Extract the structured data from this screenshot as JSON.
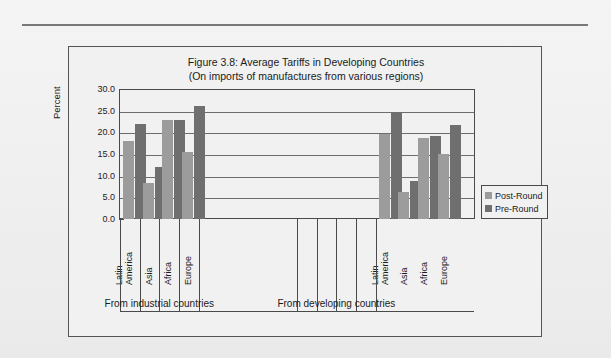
{
  "figure": {
    "title_line1": "Figure 3.8: Average Tariffs in Developing Countries",
    "title_line2": "(On imports of manufactures from various regions)"
  },
  "legend": {
    "items": [
      {
        "label": "Post-Round",
        "color": "#9c9c9c"
      },
      {
        "label": "Pre-Round",
        "color": "#6f6f6f"
      }
    ]
  },
  "groups": [
    {
      "caption": "From industrial countries"
    },
    {
      "caption": "From developing countries"
    }
  ],
  "categories_display": [
    {
      "line1": "Latin",
      "line2": "America"
    },
    {
      "line1": "Asia",
      "line2": ""
    },
    {
      "line1": "Africa",
      "line2": ""
    },
    {
      "line1": "Europe",
      "line2": ""
    }
  ],
  "chart_data": {
    "type": "bar",
    "title": "Figure 3.8: Average Tariffs in Developing Countries (On imports of manufactures from various regions)",
    "xlabel": "",
    "ylabel": "Percent",
    "ylim": [
      0.0,
      30.0
    ],
    "ytick_labels": [
      "30.0",
      "25.0",
      "20.0",
      "15.0",
      "10.0",
      "5.0",
      "0.0"
    ],
    "ytick_values": [
      30.0,
      25.0,
      20.0,
      15.0,
      10.0,
      5.0,
      0.0
    ],
    "grid": true,
    "legend_position": "right",
    "groups": [
      "From industrial countries",
      "From developing countries"
    ],
    "categories": [
      "Latin America",
      "Asia",
      "Africa",
      "Europe"
    ],
    "series": [
      {
        "name": "Post-Round",
        "color": "#9c9c9c",
        "values_by_group": {
          "From industrial countries": [
            18.2,
            8.4,
            23.0,
            15.5
          ],
          "From developing countries": [
            19.8,
            6.3,
            18.9,
            15.2
          ]
        }
      },
      {
        "name": "Pre-Round",
        "color": "#6f6f6f",
        "values_by_group": {
          "From industrial countries": [
            22.1,
            12.1,
            23.0,
            26.2
          ],
          "From developing countries": [
            24.7,
            8.8,
            19.2,
            21.8
          ]
        }
      }
    ]
  }
}
